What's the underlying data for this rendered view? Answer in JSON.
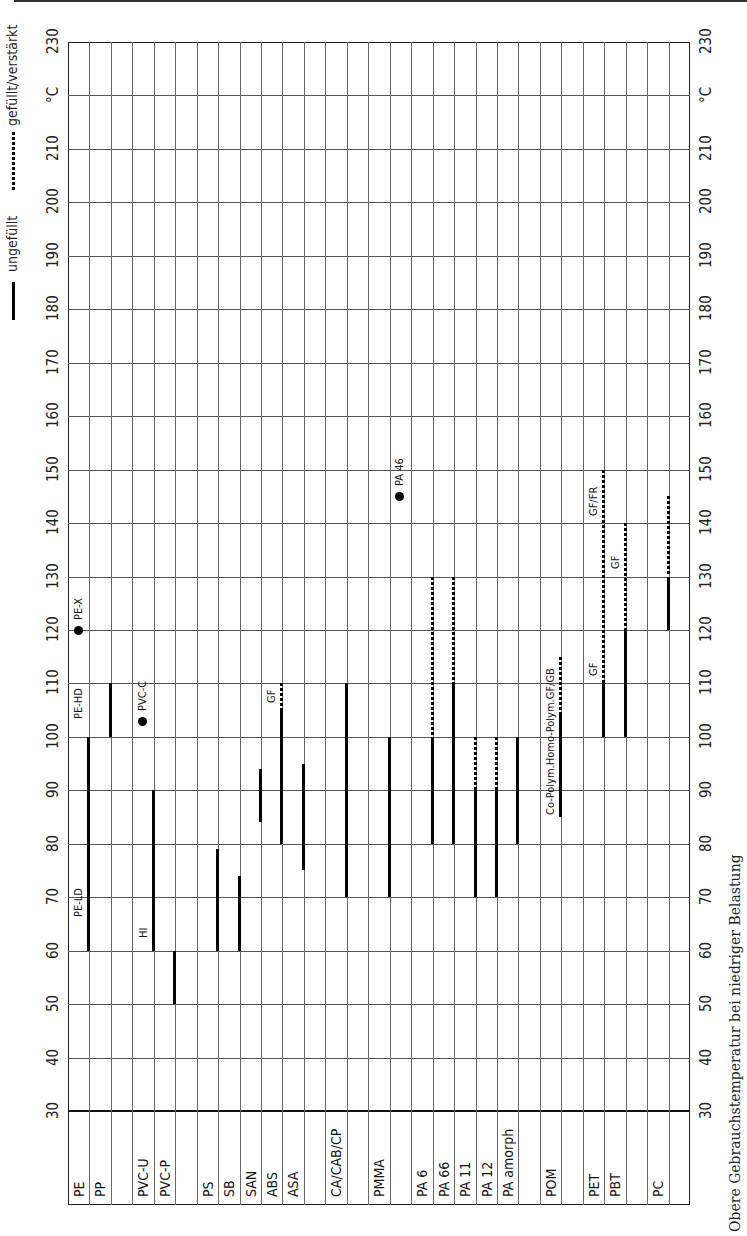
{
  "page": {
    "caption": "Obere Gebrauchstemperatur bei niedriger Belastung"
  },
  "legend": {
    "solid_label": "ungefüllt",
    "dotted_label": "gefüllt/verstärkt"
  },
  "axis": {
    "unit_label": "°C",
    "ticks": [
      "30",
      "40",
      "50",
      "60",
      "70",
      "80",
      "90",
      "100",
      "110",
      "120",
      "130",
      "140",
      "150",
      "160",
      "170",
      "180",
      "190",
      "200",
      "210",
      "220",
      "230"
    ],
    "tick_values": [
      30,
      40,
      50,
      60,
      70,
      80,
      90,
      100,
      110,
      120,
      130,
      140,
      150,
      160,
      170,
      180,
      190,
      200,
      210,
      220,
      230
    ]
  },
  "columns": [
    "PE",
    "PP",
    "",
    "PVC-U",
    "PVC-P",
    "",
    "PS",
    "SB",
    "SAN",
    "ABS",
    "ASA",
    "",
    "CA/CAB/CP",
    "",
    "PMMA",
    "",
    "PA 6",
    "PA 66",
    "PA 11",
    "PA 12",
    "PA amorph",
    "",
    "POM",
    "",
    "PET",
    "PBT",
    "",
    "PC",
    ""
  ],
  "chart_data": {
    "type": "range-bar",
    "title": "Obere Gebrauchstemperatur bei niedriger Belastung",
    "ylabel": "°C",
    "ylim": [
      30,
      230
    ],
    "grid": true,
    "orientation": "rotated page (temperature axis horizontal when read upright)",
    "legend": [
      {
        "style": "solid",
        "label": "ungefüllt"
      },
      {
        "style": "dotted",
        "label": "gefüllt/verstärkt"
      }
    ],
    "series": [
      {
        "material": "PE",
        "col": 0,
        "unfilled": [
          60,
          100
        ],
        "labels": [
          {
            "text": "PE-LD",
            "at": 66
          },
          {
            "text": "PE-HD",
            "at": 103
          }
        ]
      },
      {
        "material": "PE-X",
        "col": 0,
        "point": 120,
        "label": "PE-X"
      },
      {
        "material": "PP",
        "col": 1,
        "unfilled": [
          100,
          110
        ]
      },
      {
        "material": "PVC-U",
        "col": 3,
        "unfilled": [
          60,
          90
        ],
        "labels": [
          {
            "text": "HI",
            "at": 62
          }
        ]
      },
      {
        "material": "PVC-C",
        "col": 3,
        "point": 103,
        "label": "PVC-C"
      },
      {
        "material": "PVC-P",
        "col": 4,
        "unfilled": [
          50,
          60
        ]
      },
      {
        "material": "PS",
        "col": 6,
        "unfilled": [
          60,
          79
        ]
      },
      {
        "material": "SB",
        "col": 7,
        "unfilled": [
          60,
          74
        ]
      },
      {
        "material": "SAN",
        "col": 8,
        "unfilled": [
          84,
          94
        ]
      },
      {
        "material": "ABS",
        "col": 9,
        "unfilled": [
          80,
          105
        ],
        "filled": [
          105,
          110
        ],
        "labels": [
          {
            "text": "GF",
            "at": 106
          }
        ]
      },
      {
        "material": "ASA",
        "col": 10,
        "unfilled": [
          75,
          95
        ]
      },
      {
        "material": "CA/CAB/CP",
        "col": 12,
        "unfilled": [
          70,
          110
        ]
      },
      {
        "material": "PMMA",
        "col": 14,
        "unfilled": [
          70,
          100
        ]
      },
      {
        "material": "PA 46",
        "col": 15,
        "point": 145,
        "label": "PA 46"
      },
      {
        "material": "PA 6",
        "col": 16,
        "unfilled": [
          80,
          100
        ],
        "filled": [
          100,
          130
        ]
      },
      {
        "material": "PA 66",
        "col": 17,
        "unfilled": [
          80,
          110
        ],
        "filled": [
          110,
          130
        ]
      },
      {
        "material": "PA 11",
        "col": 18,
        "unfilled": [
          70,
          90
        ],
        "filled": [
          90,
          100
        ]
      },
      {
        "material": "PA 12",
        "col": 19,
        "unfilled": [
          70,
          90
        ],
        "filled": [
          90,
          100
        ]
      },
      {
        "material": "PA amorph",
        "col": 20,
        "unfilled": [
          80,
          100
        ]
      },
      {
        "material": "POM",
        "col": 22,
        "unfilled": [
          85,
          104
        ],
        "filled": [
          104,
          115
        ],
        "labels": [
          {
            "text": "Co-Polym.Homo-Polym.GF/GB",
            "at": 85
          }
        ]
      },
      {
        "material": "PET",
        "col": 24,
        "unfilled": [
          100,
          110
        ],
        "filled": [
          110,
          150
        ],
        "labels": [
          {
            "text": "GF",
            "at": 111
          },
          {
            "text": "GF/FR",
            "at": 141
          }
        ]
      },
      {
        "material": "PBT",
        "col": 25,
        "unfilled": [
          100,
          120
        ],
        "filled": [
          120,
          140
        ],
        "labels": [
          {
            "text": "GF",
            "at": 131
          }
        ]
      },
      {
        "material": "PC",
        "col": 27,
        "unfilled": [
          120,
          130
        ],
        "filled": [
          130,
          145
        ]
      }
    ]
  }
}
